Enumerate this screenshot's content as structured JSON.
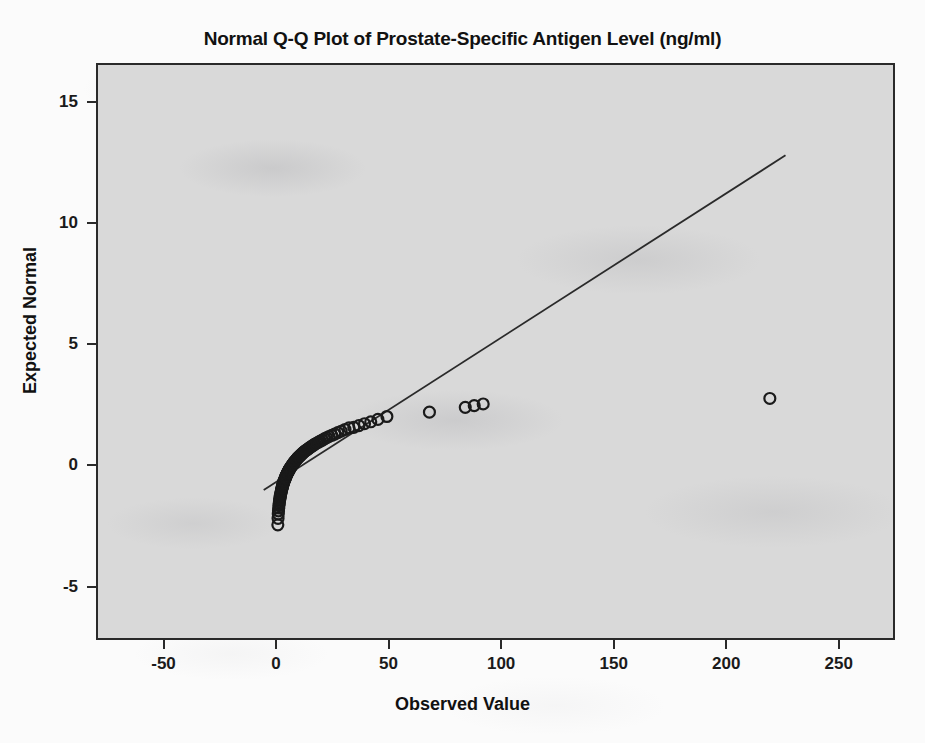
{
  "chart_data": {
    "type": "scatter",
    "title": "Normal Q-Q Plot of Prostate-Specific Antigen Level (ng/ml)",
    "xlabel": "Observed Value",
    "ylabel": "Expected Normal",
    "xlim": [
      -80,
      275
    ],
    "ylim": [
      -7.2,
      16.6
    ],
    "grid": false,
    "legend": null,
    "xticks": [
      -50,
      0,
      50,
      100,
      150,
      200,
      250
    ],
    "xtick_labels": [
      "-50",
      "0",
      "50",
      "100",
      "150",
      "200",
      "250"
    ],
    "yticks": [
      15,
      10,
      5,
      0,
      -5
    ],
    "ytick_labels": [
      "15",
      "10",
      "5",
      "0",
      "-5"
    ],
    "marker": "open-circle",
    "marker_size": 11,
    "marker_color": "#1a1a1a",
    "marker_fill": "none",
    "line_color": "#2a2a2a",
    "background_color": "#d9d9d9",
    "frame_color": "#2a2a2a",
    "reference_line": {
      "label": "normal reference line",
      "x_start": -6.0,
      "y_start": -1.05,
      "x_end": 227.0,
      "y_end": 12.85
    },
    "series": [
      {
        "name": "Prostate-Specific Antigen Level (ng/ml)",
        "points": [
          [
            0.3,
            -2.5
          ],
          [
            0.4,
            -2.23
          ],
          [
            0.5,
            -2.05
          ],
          [
            0.6,
            -1.92
          ],
          [
            0.7,
            -1.8
          ],
          [
            0.8,
            -1.7
          ],
          [
            0.9,
            -1.62
          ],
          [
            1.0,
            -1.55
          ],
          [
            1.1,
            -1.48
          ],
          [
            1.2,
            -1.42
          ],
          [
            1.3,
            -1.36
          ],
          [
            1.4,
            -1.31
          ],
          [
            1.5,
            -1.26
          ],
          [
            1.6,
            -1.21
          ],
          [
            1.7,
            -1.17
          ],
          [
            1.8,
            -1.12
          ],
          [
            1.9,
            -1.08
          ],
          [
            2.0,
            -1.04
          ],
          [
            2.1,
            -1.0
          ],
          [
            2.2,
            -0.96
          ],
          [
            2.3,
            -0.93
          ],
          [
            2.4,
            -0.89
          ],
          [
            2.5,
            -0.86
          ],
          [
            2.6,
            -0.82
          ],
          [
            2.7,
            -0.79
          ],
          [
            2.8,
            -0.76
          ],
          [
            2.9,
            -0.73
          ],
          [
            3.0,
            -0.7
          ],
          [
            3.2,
            -0.67
          ],
          [
            3.3,
            -0.64
          ],
          [
            3.4,
            -0.61
          ],
          [
            3.5,
            -0.58
          ],
          [
            3.7,
            -0.55
          ],
          [
            3.8,
            -0.52
          ],
          [
            3.9,
            -0.49
          ],
          [
            4.0,
            -0.46
          ],
          [
            4.2,
            -0.44
          ],
          [
            4.3,
            -0.41
          ],
          [
            4.4,
            -0.38
          ],
          [
            4.6,
            -0.35
          ],
          [
            4.7,
            -0.33
          ],
          [
            4.9,
            -0.3
          ],
          [
            5.0,
            -0.27
          ],
          [
            5.2,
            -0.25
          ],
          [
            5.3,
            -0.22
          ],
          [
            5.5,
            -0.19
          ],
          [
            5.7,
            -0.17
          ],
          [
            5.8,
            -0.14
          ],
          [
            6.0,
            -0.11
          ],
          [
            6.2,
            -0.09
          ],
          [
            6.4,
            -0.06
          ],
          [
            6.6,
            -0.03
          ],
          [
            6.8,
            -0.01
          ],
          [
            7.0,
            0.02
          ],
          [
            7.2,
            0.04
          ],
          [
            7.4,
            0.07
          ],
          [
            7.6,
            0.1
          ],
          [
            7.8,
            0.12
          ],
          [
            8.0,
            0.15
          ],
          [
            8.3,
            0.18
          ],
          [
            8.5,
            0.2
          ],
          [
            8.8,
            0.23
          ],
          [
            9.0,
            0.26
          ],
          [
            9.3,
            0.29
          ],
          [
            9.6,
            0.31
          ],
          [
            9.9,
            0.34
          ],
          [
            10.2,
            0.37
          ],
          [
            10.5,
            0.4
          ],
          [
            10.8,
            0.43
          ],
          [
            11.2,
            0.46
          ],
          [
            11.5,
            0.49
          ],
          [
            11.9,
            0.52
          ],
          [
            12.3,
            0.55
          ],
          [
            12.7,
            0.58
          ],
          [
            13.2,
            0.61
          ],
          [
            13.6,
            0.64
          ],
          [
            14.1,
            0.68
          ],
          [
            14.6,
            0.71
          ],
          [
            15.2,
            0.75
          ],
          [
            15.8,
            0.78
          ],
          [
            16.4,
            0.82
          ],
          [
            17.0,
            0.86
          ],
          [
            17.8,
            0.9
          ],
          [
            18.5,
            0.94
          ],
          [
            19.3,
            0.98
          ],
          [
            20.2,
            1.02
          ],
          [
            21.1,
            1.07
          ],
          [
            22.1,
            1.12
          ],
          [
            23.2,
            1.17
          ],
          [
            24.4,
            1.22
          ],
          [
            25.7,
            1.27
          ],
          [
            27.1,
            1.33
          ],
          [
            28.6,
            1.39
          ],
          [
            30.3,
            1.46
          ],
          [
            32.1,
            1.53
          ],
          [
            34.2,
            1.55
          ],
          [
            36.5,
            1.62
          ],
          [
            39.0,
            1.7
          ],
          [
            41.8,
            1.78
          ],
          [
            45.0,
            1.88
          ],
          [
            49.0,
            2.0
          ],
          [
            68.0,
            2.18
          ],
          [
            84.0,
            2.38
          ],
          [
            88.0,
            2.45
          ],
          [
            92.0,
            2.52
          ],
          [
            220.0,
            2.75
          ]
        ]
      }
    ],
    "notable_outliers": [
      {
        "x": 220.0,
        "y": 2.75,
        "note": "extreme high PSA value"
      },
      {
        "x": 92.0,
        "y": 2.52
      },
      {
        "x": 68.0,
        "y": 2.18
      }
    ]
  }
}
